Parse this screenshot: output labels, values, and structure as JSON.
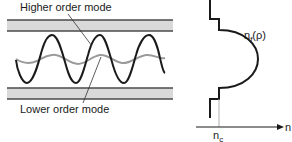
{
  "labels": {
    "higher_mode": "Higher order mode",
    "lower_mode": "Lower order mode",
    "profile_n": "n",
    "profile_sub": "f",
    "profile_arg": "(ρ)",
    "nc_main": "n",
    "nc_sub": "c",
    "axis": "n"
  },
  "colors": {
    "cladding_fill": "#d9d9d9",
    "cladding_edge": "#4a4a4a",
    "higher_mode": "#1a1a1a",
    "lower_mode": "#9a9a9a",
    "profile": "#1a1a1a",
    "guide": "#b0b0b0"
  }
}
